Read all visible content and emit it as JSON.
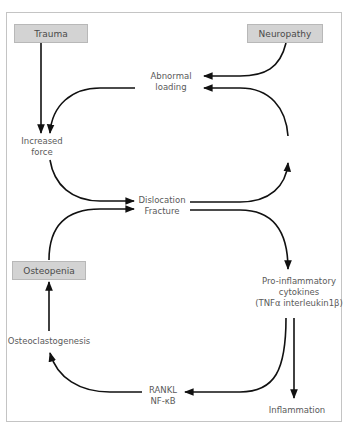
{
  "diagram": {
    "nodes": {
      "trauma": "Trauma",
      "neuropathy": "Neuropathy",
      "abnormal_loading": [
        "Abnormal",
        "loading"
      ],
      "increased_force": [
        "Increased",
        "force"
      ],
      "dislocation_fracture": [
        "Dislocation",
        "Fracture"
      ],
      "osteopenia": "Osteopenia",
      "pro_inflammatory": [
        "Pro-inflammatory",
        "cytokines",
        "(TNFα interleukin1β)"
      ],
      "osteoclastogenesis": "Osteoclastogenesis",
      "rankl": [
        "RANKL",
        "NF-κB"
      ],
      "inflammation": "Inflammation"
    },
    "edges": [
      {
        "from": "Trauma",
        "to": "Increased force"
      },
      {
        "from": "Neuropathy",
        "to": "Abnormal loading"
      },
      {
        "from": "Abnormal loading",
        "to": "Increased force"
      },
      {
        "from": "Dislocation Fracture",
        "to": "Abnormal loading"
      },
      {
        "from": "Increased force",
        "to": "Dislocation Fracture"
      },
      {
        "from": "Osteopenia",
        "to": "Dislocation Fracture"
      },
      {
        "from": "Dislocation Fracture",
        "to": "Pro-inflammatory cytokines"
      },
      {
        "from": "Pro-inflammatory cytokines",
        "to": "RANKL NF-κB"
      },
      {
        "from": "Pro-inflammatory cytokines",
        "to": "Inflammation"
      },
      {
        "from": "RANKL NF-κB",
        "to": "Osteoclastogenesis"
      },
      {
        "from": "Osteoclastogenesis",
        "to": "Osteopenia"
      }
    ],
    "colors": {
      "box_fill": "#d3d3d3",
      "arrow": "#111111",
      "text": "#5a5a5a",
      "frame": "#c4c4c4"
    }
  }
}
